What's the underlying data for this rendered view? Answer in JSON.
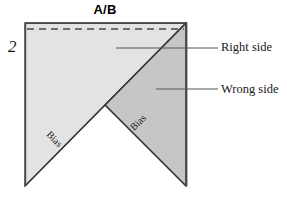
{
  "figure": {
    "title": "A/B",
    "step_number": "2",
    "labels": {
      "right_side": "Right side",
      "wrong_side": "Wrong side",
      "bias_left": "Bias",
      "bias_right": "Bias"
    },
    "colors": {
      "right_side_fill": "#E3E3E3",
      "wrong_side_fill": "#C6C6C6",
      "outline": "#3A3A3A",
      "dashed_line": "#4A4A4A",
      "leader_line": "#555555",
      "text": "#1A1A1A",
      "background": "#FFFFFF"
    },
    "geometry": {
      "top_left": [
        25,
        23
      ],
      "top_right": [
        186,
        23
      ],
      "bottom_left": [
        25,
        186
      ],
      "bottom_right": [
        186,
        186
      ],
      "notch_point": [
        105,
        105
      ],
      "dashed_seam_y": 29
    }
  }
}
